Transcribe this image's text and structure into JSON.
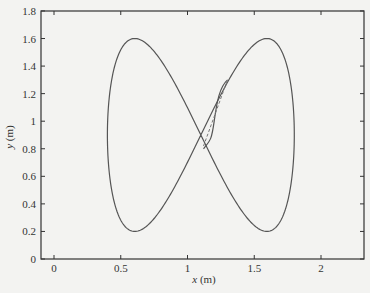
{
  "chart_data": {
    "type": "line",
    "title": "",
    "xlabel": "x (m)",
    "ylabel": "y (m)",
    "xlim": [
      -0.1,
      2.32
    ],
    "ylim": [
      0,
      1.8
    ],
    "xticks": [
      0,
      0.5,
      1,
      1.5,
      2
    ],
    "xtick_labels": [
      "0",
      "0.5",
      "1",
      "1.5",
      "2"
    ],
    "yticks": [
      0,
      0.2,
      0.4,
      0.6,
      0.8,
      1,
      1.2,
      1.4,
      1.6,
      1.8
    ],
    "ytick_labels": [
      "0",
      "0.2",
      "0.4",
      "0.6",
      "0.8",
      "1",
      "1.2",
      "1.4",
      "1.6",
      "1.8"
    ],
    "grid": false,
    "legend": null,
    "series": [
      {
        "name": "reference figure-eight trajectory",
        "style": "solid",
        "parametric": "x = 1.1 + 0.7 cos(t), y = 0.9 + 0.7 sin(2t)",
        "x": [
          1.8,
          1.595,
          1.1,
          0.605,
          0.4,
          0.605,
          1.1,
          1.595,
          1.8
        ],
        "y": [
          0.9,
          1.6,
          0.9,
          0.2,
          0.9,
          1.6,
          0.9,
          0.2,
          0.9
        ]
      },
      {
        "name": "actual trajectory (transient)",
        "style": "solid",
        "x": [
          1.12,
          1.15,
          1.19,
          1.24,
          1.3
        ],
        "y": [
          0.8,
          0.82,
          0.95,
          1.15,
          1.3
        ]
      },
      {
        "name": "initial path",
        "style": "dashed",
        "x": [
          1.12,
          1.3
        ],
        "y": [
          0.82,
          1.3
        ]
      }
    ]
  },
  "axes": {
    "xlabel": "x (m)",
    "ylabel": "y (m)"
  }
}
